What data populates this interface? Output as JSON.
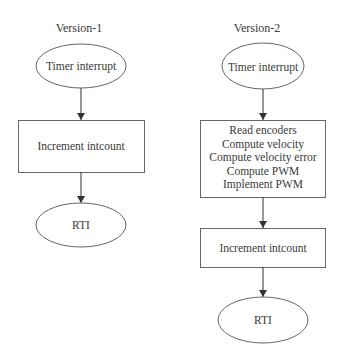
{
  "diagram": {
    "type": "flowchart",
    "flows": [
      {
        "title": "Version-1",
        "nodes": [
          {
            "shape": "ellipse",
            "label": "Timer interrupt"
          },
          {
            "shape": "rect",
            "label": "Increment intcount"
          },
          {
            "shape": "ellipse",
            "label": "RTI"
          }
        ],
        "edges": [
          [
            0,
            1
          ],
          [
            1,
            2
          ]
        ]
      },
      {
        "title": "Version-2",
        "nodes": [
          {
            "shape": "ellipse",
            "label": "Timer interrupt"
          },
          {
            "shape": "rect",
            "lines": [
              "Read encoders",
              "Compute velocity",
              "Compute velocity error",
              "Compute PWM",
              "Implement PWM"
            ]
          },
          {
            "shape": "rect",
            "label": "Increment intcount"
          },
          {
            "shape": "ellipse",
            "label": "RTI"
          }
        ],
        "edges": [
          [
            0,
            1
          ],
          [
            1,
            2
          ],
          [
            2,
            3
          ]
        ]
      }
    ],
    "colors": {
      "stroke": "#555555",
      "text": "#3a3a3a",
      "background": "#ffffff"
    }
  }
}
